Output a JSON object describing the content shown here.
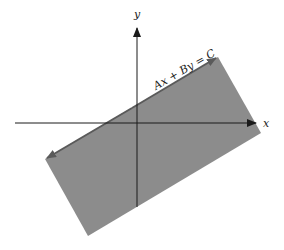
{
  "diagram": {
    "type": "half-plane",
    "equation_label": "Ax + By = C",
    "x_axis_label": "x",
    "y_axis_label": "y",
    "colors": {
      "region_fill": "#8c8c8c",
      "boundary_line": "#5a5a5a",
      "axes": "#1a1a1a",
      "background": "#ffffff"
    },
    "region_vertices": [
      [
        218,
        57
      ],
      [
        261,
        133
      ],
      [
        88,
        236
      ],
      [
        45,
        159
      ]
    ],
    "boundary_line": {
      "from": [
        218,
        57
      ],
      "to": [
        45,
        159
      ]
    },
    "x_axis": {
      "from": [
        15,
        123
      ],
      "to": [
        256,
        123
      ]
    },
    "y_axis": {
      "from": [
        137,
        207
      ],
      "to": [
        137,
        28
      ]
    }
  }
}
